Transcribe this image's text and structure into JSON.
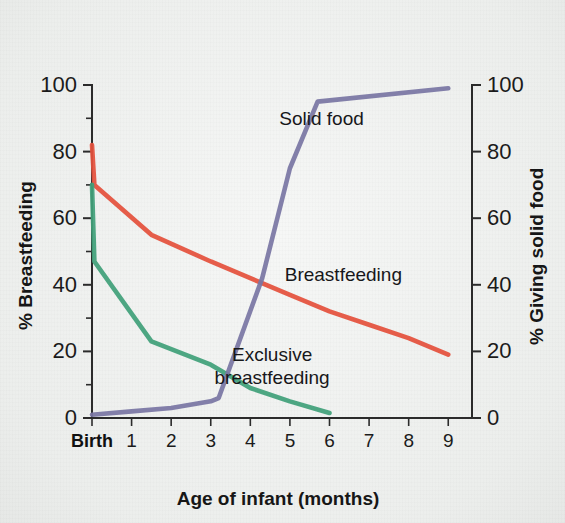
{
  "figure": {
    "background_color": "#f1f3f1",
    "axis_color": "#2b2b2b"
  },
  "chart_data": {
    "type": "line",
    "title": "",
    "xlabel": "Age of infant (months)",
    "ylabel": "% Breastfeeding",
    "y2label": "% Giving solid food",
    "xlim": [
      0,
      9.6
    ],
    "ylim": [
      0,
      100
    ],
    "y2lim": [
      0,
      100
    ],
    "grid": false,
    "legend": "inline-labels",
    "x_tick_labels": [
      "Birth",
      "1",
      "2",
      "3",
      "4",
      "5",
      "6",
      "7",
      "8",
      "9"
    ],
    "x_tick_values": [
      0,
      1,
      2,
      3,
      4,
      5,
      6,
      7,
      8,
      9
    ],
    "y_tick_labels": [
      "0",
      "20",
      "40",
      "60",
      "80",
      "100"
    ],
    "y_tick_values": [
      0,
      20,
      40,
      60,
      80,
      100
    ],
    "y_minor_tick_values": [
      10,
      30,
      50,
      70,
      90
    ],
    "y2_tick_labels": [
      "0",
      "20",
      "40",
      "60",
      "80",
      "100"
    ],
    "y2_tick_values": [
      0,
      20,
      40,
      60,
      80,
      100
    ],
    "series": [
      {
        "name": "Breastfeeding",
        "label": "Breastfeeding",
        "color": "#e4513c",
        "axis": "left",
        "label_x": 6.35,
        "label_y": 41,
        "points": [
          [
            0,
            82
          ],
          [
            0.06,
            70
          ],
          [
            1.5,
            55
          ],
          [
            3,
            47
          ],
          [
            4,
            42
          ],
          [
            5,
            37
          ],
          [
            6,
            32
          ],
          [
            7,
            28
          ],
          [
            8,
            24
          ],
          [
            9,
            19
          ]
        ]
      },
      {
        "name": "Exclusive breastfeeding",
        "label": "Exclusive breastfeeding",
        "color": "#41a07a",
        "axis": "left",
        "label_x": 4.55,
        "label_y": 17,
        "points": [
          [
            0,
            70
          ],
          [
            0.06,
            47
          ],
          [
            1.5,
            23
          ],
          [
            3,
            16
          ],
          [
            4,
            9
          ],
          [
            5,
            5
          ],
          [
            6,
            1.5
          ]
        ]
      },
      {
        "name": "Solid food",
        "label": "Solid food",
        "color": "#7a76a4",
        "axis": "right",
        "label_x": 5.8,
        "label_y": 88,
        "points": [
          [
            0,
            1
          ],
          [
            1,
            2
          ],
          [
            2,
            3
          ],
          [
            3,
            5
          ],
          [
            3.2,
            6
          ],
          [
            4.3,
            42
          ],
          [
            5,
            75
          ],
          [
            5.7,
            95
          ],
          [
            9,
            99
          ]
        ]
      }
    ]
  }
}
